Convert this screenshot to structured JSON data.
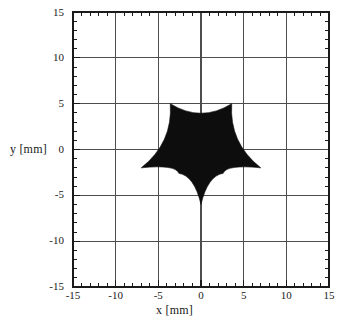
{
  "chart_data": {
    "type": "scatter",
    "title": "",
    "xlabel": "x [mm]",
    "ylabel": "y [mm]",
    "xlim": [
      -15,
      15
    ],
    "ylim": [
      -15,
      15
    ],
    "xticks": [
      -15,
      -10,
      -5,
      0,
      5,
      10,
      15
    ],
    "yticks": [
      -15,
      -10,
      -5,
      0,
      5,
      10,
      15
    ],
    "xtick_labels": [
      "-15",
      "-10",
      "-5",
      "0",
      "5",
      "10",
      "15"
    ],
    "ytick_labels": [
      "-15",
      "-10",
      "-5",
      "0",
      "5",
      "10",
      "15"
    ],
    "minor_tick_step": 1,
    "grid": true,
    "grid_step": 5,
    "legend": null,
    "series": [
      {
        "name": "filled-region",
        "type": "filled-polygon",
        "fill_color": "#0d0d0d",
        "description": "solid black five-pointed star with concave curved edges, centered near x=0 y=0",
        "star_points": 5,
        "outer_radius_mm": 7.0,
        "inner_radius_mm": 3.6,
        "rotation_deg": 180,
        "concavity": 0.38,
        "center": [
          0,
          -0.5
        ],
        "vertices_mm": [
          [
            -3.6,
            5.0
          ],
          [
            3.6,
            5.0
          ],
          [
            7.0,
            -2.0
          ],
          [
            2.6,
            -2.6
          ],
          [
            0.0,
            -6.0
          ],
          [
            -2.6,
            -2.6
          ],
          [
            -7.0,
            -2.0
          ]
        ],
        "extent_mm": {
          "x_min": -7.0,
          "x_max": 7.0,
          "y_min": -6.0,
          "y_max": 5.0
        }
      }
    ]
  },
  "axes": {
    "frame_color": "#1a1a1a",
    "grid_color": "#555555",
    "background": "#ffffff"
  }
}
